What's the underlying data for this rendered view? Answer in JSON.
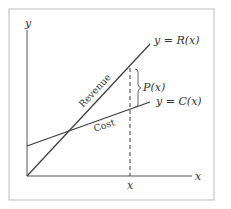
{
  "diagram": {
    "type": "cost-revenue-profit graph",
    "axes": {
      "x_label": "x",
      "y_label": "y",
      "x_tick_label": "x"
    },
    "lines": [
      {
        "name": "revenue",
        "equation_label": "y = R(x)",
        "inline_label": "Revenue"
      },
      {
        "name": "cost",
        "equation_label": "y = C(x)",
        "inline_label": "Cost"
      }
    ],
    "gap": {
      "label": "P(x)",
      "meaning": "profit"
    }
  },
  "colors": {
    "frame": "#bdbdbd",
    "line": "#3a3a3a",
    "text": "#333333",
    "background": "#ffffff"
  }
}
